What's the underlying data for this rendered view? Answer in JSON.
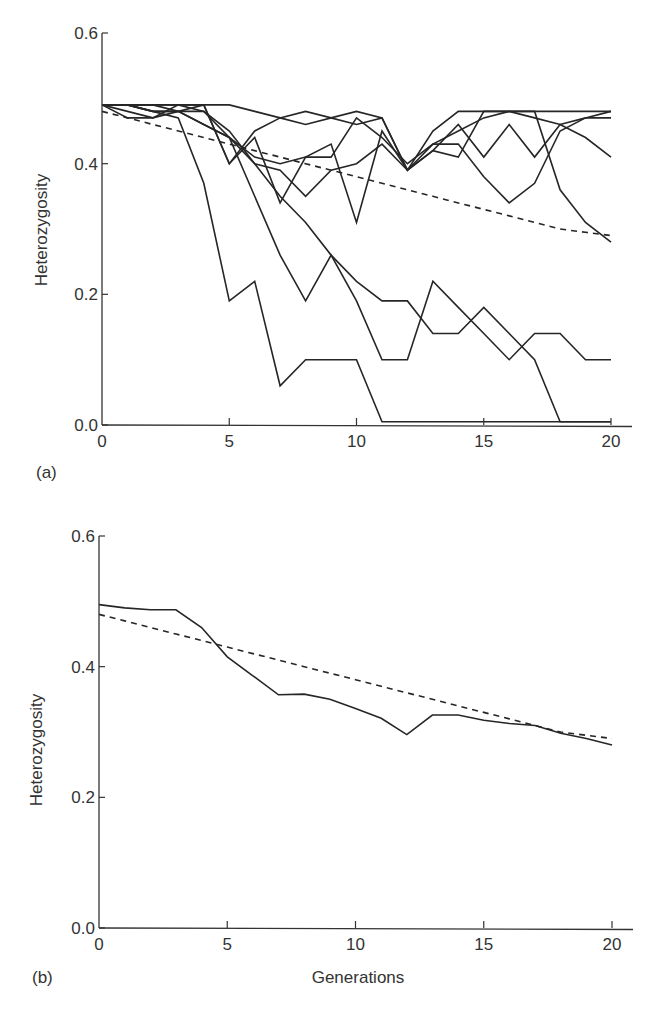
{
  "chart_data": [
    {
      "panel": "(a)",
      "type": "line",
      "title": "",
      "xlabel": "",
      "ylabel": "Heterozygosity",
      "xlim": [
        0,
        20
      ],
      "ylim": [
        0,
        0.6
      ],
      "xticks": [
        "0",
        "5",
        "10",
        "15",
        "20"
      ],
      "yticks": [
        "0.0",
        "0.2",
        "0.4",
        "0.6"
      ],
      "grid": false,
      "legend": null,
      "x": [
        0,
        1,
        2,
        3,
        4,
        5,
        6,
        7,
        8,
        9,
        10,
        11,
        12,
        13,
        14,
        15,
        16,
        17,
        18,
        19,
        20
      ],
      "series": [
        {
          "name": "expected",
          "style": "dashed",
          "values": [
            0.48,
            0.47,
            0.46,
            0.45,
            0.44,
            0.43,
            0.42,
            0.41,
            0.4,
            0.39,
            0.38,
            0.37,
            0.36,
            0.35,
            0.34,
            0.33,
            0.32,
            0.31,
            0.3,
            0.295,
            0.29
          ]
        },
        {
          "name": "replicate 1",
          "style": "solid",
          "values": [
            0.49,
            0.49,
            0.49,
            0.49,
            0.49,
            0.49,
            0.48,
            0.47,
            0.46,
            0.47,
            0.46,
            0.47,
            0.39,
            0.45,
            0.48,
            0.48,
            0.48,
            0.48,
            0.48,
            0.48,
            0.48
          ]
        },
        {
          "name": "replicate 2",
          "style": "solid",
          "values": [
            0.49,
            0.48,
            0.47,
            0.49,
            0.49,
            0.4,
            0.45,
            0.47,
            0.48,
            0.47,
            0.48,
            0.47,
            0.39,
            0.42,
            0.46,
            0.41,
            0.46,
            0.41,
            0.46,
            0.44,
            0.41
          ]
        },
        {
          "name": "replicate 3",
          "style": "solid",
          "values": [
            0.49,
            0.49,
            0.48,
            0.48,
            0.46,
            0.44,
            0.41,
            0.4,
            0.41,
            0.41,
            0.47,
            0.44,
            0.4,
            0.43,
            0.43,
            0.38,
            0.34,
            0.37,
            0.45,
            0.47,
            0.48
          ]
        },
        {
          "name": "replicate 4",
          "style": "solid",
          "values": [
            0.49,
            0.49,
            0.48,
            0.48,
            0.46,
            0.44,
            0.4,
            0.39,
            0.35,
            0.39,
            0.4,
            0.43,
            0.39,
            0.43,
            0.45,
            0.47,
            0.48,
            0.48,
            0.36,
            0.31,
            0.28
          ]
        },
        {
          "name": "replicate 5",
          "style": "solid",
          "values": [
            0.49,
            0.47,
            0.47,
            0.48,
            0.49,
            0.4,
            0.44,
            0.34,
            0.41,
            0.43,
            0.31,
            0.45,
            0.39,
            0.42,
            0.41,
            0.48,
            0.48,
            0.47,
            0.46,
            0.47,
            0.47
          ]
        },
        {
          "name": "replicate 6 (lost at gen 11)",
          "style": "solid",
          "values": [
            0.49,
            0.49,
            0.48,
            0.47,
            0.37,
            0.19,
            0.22,
            0.06,
            0.1,
            0.1,
            0.1,
            0.005,
            0.005,
            0.005,
            0.005,
            0.005,
            0.005,
            0.005,
            0.005,
            0.005,
            0.005
          ]
        },
        {
          "name": "replicate 7 (lost at gen 18)",
          "style": "solid",
          "values": [
            0.49,
            0.49,
            0.49,
            0.48,
            0.48,
            0.45,
            0.4,
            0.35,
            0.31,
            0.26,
            0.22,
            0.19,
            0.19,
            0.14,
            0.14,
            0.18,
            0.14,
            0.1,
            0.005,
            0.005,
            0.005
          ]
        },
        {
          "name": "replicate 8",
          "style": "solid",
          "values": [
            0.49,
            0.49,
            0.49,
            0.49,
            0.48,
            0.44,
            0.35,
            0.26,
            0.19,
            0.26,
            0.19,
            0.1,
            0.1,
            0.22,
            0.18,
            0.14,
            0.1,
            0.14,
            0.14,
            0.1,
            0.1
          ]
        }
      ]
    },
    {
      "panel": "(b)",
      "type": "line",
      "title": "",
      "xlabel": "Generations",
      "ylabel": "Heterozygosity",
      "xlim": [
        0,
        20
      ],
      "ylim": [
        0,
        0.6
      ],
      "xticks": [
        "0",
        "5",
        "10",
        "15",
        "20"
      ],
      "yticks": [
        "0.0",
        "0.2",
        "0.4",
        "0.6"
      ],
      "grid": false,
      "legend": null,
      "x": [
        0,
        1,
        2,
        3,
        4,
        5,
        6,
        7,
        8,
        9,
        10,
        11,
        12,
        13,
        14,
        15,
        16,
        17,
        18,
        19,
        20
      ],
      "series": [
        {
          "name": "expected",
          "style": "dashed",
          "values": [
            0.48,
            0.47,
            0.46,
            0.45,
            0.44,
            0.43,
            0.42,
            0.41,
            0.4,
            0.39,
            0.38,
            0.37,
            0.36,
            0.35,
            0.34,
            0.33,
            0.32,
            0.31,
            0.3,
            0.295,
            0.29
          ]
        },
        {
          "name": "mean of replicates",
          "style": "solid",
          "values": [
            0.495,
            0.49,
            0.487,
            0.487,
            0.46,
            0.415,
            0.386,
            0.357,
            0.358,
            0.35,
            0.336,
            0.321,
            0.296,
            0.326,
            0.326,
            0.318,
            0.313,
            0.31,
            0.298,
            0.29,
            0.28
          ]
        }
      ]
    }
  ],
  "labels": {
    "panel_a": "(a)",
    "panel_b": "(b)",
    "ylabel_a": "Heterozygosity",
    "ylabel_b": "Heterozygosity",
    "xlabel_b": "Generations"
  }
}
